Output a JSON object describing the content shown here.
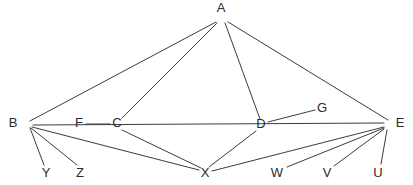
{
  "diagram": {
    "type": "node-link-graph",
    "background_color": "#ffffff",
    "edge_color": "#3c3c3c",
    "label_color": "#2b2b2b",
    "width": 413,
    "height": 185,
    "nodes": [
      {
        "id": "A",
        "label": "A",
        "x": 221,
        "y": 17,
        "label_x": 221,
        "label_y": 9,
        "label_anchor": "middle"
      },
      {
        "id": "B",
        "label": "B",
        "x": 27,
        "y": 124,
        "label_x": 13,
        "label_y": 124,
        "label_anchor": "middle"
      },
      {
        "id": "C",
        "label": "C",
        "x": 117,
        "y": 124,
        "label_x": 117,
        "label_y": 124,
        "label_anchor": "middle"
      },
      {
        "id": "D",
        "label": "D",
        "x": 261,
        "y": 125,
        "label_x": 261,
        "label_y": 125,
        "label_anchor": "middle"
      },
      {
        "id": "E",
        "label": "E",
        "x": 389,
        "y": 124,
        "label_x": 400,
        "label_y": 124,
        "label_anchor": "middle"
      },
      {
        "id": "F",
        "label": "F",
        "x": 79,
        "y": 124,
        "label_x": 79,
        "label_y": 124,
        "label_anchor": "middle"
      },
      {
        "id": "G",
        "label": "G",
        "x": 322,
        "y": 109,
        "label_x": 322,
        "label_y": 109,
        "label_anchor": "middle"
      },
      {
        "id": "X",
        "label": "X",
        "x": 205,
        "y": 172,
        "label_x": 205,
        "label_y": 174,
        "label_anchor": "middle"
      },
      {
        "id": "Y",
        "label": "Y",
        "x": 46,
        "y": 169,
        "label_x": 46,
        "label_y": 174,
        "label_anchor": "middle"
      },
      {
        "id": "Z",
        "label": "Z",
        "x": 80,
        "y": 169,
        "label_x": 80,
        "label_y": 174,
        "label_anchor": "middle"
      },
      {
        "id": "W",
        "label": "W",
        "x": 277,
        "y": 169,
        "label_x": 277,
        "label_y": 174,
        "label_anchor": "middle"
      },
      {
        "id": "V",
        "label": "V",
        "x": 327,
        "y": 169,
        "label_x": 327,
        "label_y": 174,
        "label_anchor": "middle"
      },
      {
        "id": "U",
        "label": "U",
        "x": 378,
        "y": 169,
        "label_x": 378,
        "label_y": 174,
        "label_anchor": "middle"
      }
    ],
    "edges": [
      {
        "id": "A-B",
        "from": "A",
        "to": "B",
        "x1": 216,
        "y1": 22,
        "x2": 30,
        "y2": 121
      },
      {
        "id": "A-C",
        "from": "A",
        "to": "C",
        "x1": 217,
        "y1": 23,
        "x2": 122,
        "y2": 118
      },
      {
        "id": "A-D",
        "from": "A",
        "to": "D",
        "x1": 225,
        "y1": 23,
        "x2": 260,
        "y2": 119
      },
      {
        "id": "A-E",
        "from": "A",
        "to": "E",
        "x1": 228,
        "y1": 22,
        "x2": 388,
        "y2": 120
      },
      {
        "id": "B-Y",
        "from": "B",
        "to": "Y",
        "x1": 30,
        "y1": 128,
        "x2": 44,
        "y2": 165
      },
      {
        "id": "B-Z",
        "from": "B",
        "to": "Z",
        "x1": 31,
        "y1": 128,
        "x2": 77,
        "y2": 165
      },
      {
        "id": "B-X",
        "from": "B",
        "to": "X",
        "x1": 32,
        "y1": 127,
        "x2": 199,
        "y2": 170
      },
      {
        "id": "B-E",
        "from": "B",
        "to": "E",
        "x1": 33,
        "y1": 125,
        "x2": 384,
        "y2": 123
      },
      {
        "id": "F-C",
        "from": "F",
        "to": "C",
        "x1": 86,
        "y1": 124,
        "x2": 110,
        "y2": 124
      },
      {
        "id": "C-X",
        "from": "C",
        "to": "X",
        "x1": 122,
        "y1": 130,
        "x2": 201,
        "y2": 168
      },
      {
        "id": "D-G",
        "from": "D",
        "to": "G",
        "x1": 268,
        "y1": 122,
        "x2": 315,
        "y2": 110
      },
      {
        "id": "D-X",
        "from": "D",
        "to": "X",
        "x1": 256,
        "y1": 131,
        "x2": 209,
        "y2": 167
      },
      {
        "id": "X-E",
        "from": "X",
        "to": "E",
        "x1": 212,
        "y1": 171,
        "x2": 384,
        "y2": 127
      },
      {
        "id": "W-E",
        "from": "W",
        "to": "E",
        "x1": 287,
        "y1": 167,
        "x2": 384,
        "y2": 128
      },
      {
        "id": "V-E",
        "from": "V",
        "to": "E",
        "x1": 334,
        "y1": 166,
        "x2": 384,
        "y2": 129
      },
      {
        "id": "U-E",
        "from": "U",
        "to": "E",
        "x1": 381,
        "y1": 164,
        "x2": 387,
        "y2": 130
      }
    ]
  }
}
